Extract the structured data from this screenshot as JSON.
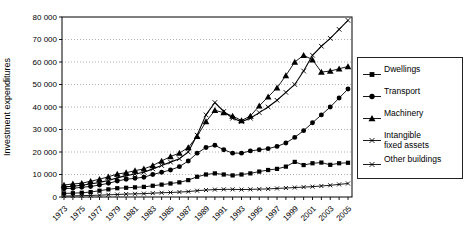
{
  "chart_data": {
    "type": "line",
    "title": "",
    "xlabel": "",
    "ylabel": "Investment expenditures",
    "ylim": [
      0,
      80000
    ],
    "ytick_step": 10000,
    "ytick_labels": [
      "0",
      "10 000",
      "20 000",
      "30 000",
      "40 000",
      "50 000",
      "60 000",
      "70 000",
      "80 000"
    ],
    "xtick_labels": [
      "1973",
      "1975",
      "1977",
      "1979",
      "1981",
      "1983",
      "1985",
      "1987",
      "1989",
      "1991",
      "1993",
      "1995",
      "1997",
      "1999",
      "2001",
      "2003",
      "2005"
    ],
    "x": [
      1973,
      1974,
      1975,
      1976,
      1977,
      1978,
      1979,
      1980,
      1981,
      1982,
      1983,
      1984,
      1985,
      1986,
      1987,
      1988,
      1989,
      1990,
      1991,
      1992,
      1993,
      1994,
      1995,
      1996,
      1997,
      1998,
      1999,
      2000,
      2001,
      2002,
      2003,
      2004,
      2005
    ],
    "grid": "horizontal-dotted",
    "legend_position": "right",
    "series_color": "#000000",
    "series": [
      {
        "name": "Dwellings",
        "marker": "square",
        "values": [
          1600,
          1700,
          1900,
          2200,
          2800,
          3400,
          3900,
          4100,
          4300,
          4500,
          5000,
          5500,
          6000,
          6500,
          7500,
          9000,
          10000,
          10500,
          10000,
          9600,
          10000,
          10500,
          11300,
          12000,
          12500,
          13500,
          15600,
          14200,
          15000,
          15300,
          14300,
          15000,
          15200
        ]
      },
      {
        "name": "Transport",
        "marker": "circle",
        "values": [
          3700,
          3900,
          4300,
          4700,
          5300,
          6100,
          7100,
          7900,
          8300,
          8800,
          10000,
          11000,
          12000,
          13500,
          16000,
          19500,
          22000,
          23000,
          21000,
          19500,
          19500,
          20500,
          21000,
          21500,
          22500,
          24000,
          26500,
          29500,
          33000,
          36500,
          40000,
          44000,
          48000
        ]
      },
      {
        "name": "Machinery",
        "marker": "triangle",
        "values": [
          5300,
          5800,
          6100,
          7000,
          7900,
          9000,
          10200,
          10800,
          11700,
          12500,
          14000,
          16000,
          18000,
          19500,
          22000,
          27000,
          33500,
          38500,
          37500,
          36000,
          34000,
          36000,
          40500,
          44500,
          48500,
          54000,
          60000,
          63000,
          61000,
          55500,
          56000,
          57000,
          58000
        ]
      },
      {
        "name": "Intangible fixed assets",
        "marker": "x",
        "values": [
          400,
          500,
          600,
          700,
          800,
          1000,
          1100,
          1300,
          1400,
          1500,
          1700,
          1900,
          2000,
          2200,
          2400,
          2800,
          3100,
          3300,
          3400,
          3400,
          3300,
          3400,
          3500,
          3600,
          3800,
          4000,
          4200,
          4400,
          4600,
          4900,
          5200,
          5600,
          6000
        ]
      },
      {
        "name": "Other buildings",
        "marker": "x",
        "values": [
          4500,
          4800,
          5200,
          5800,
          6500,
          7300,
          8500,
          9500,
          10200,
          11000,
          12500,
          14000,
          15500,
          17000,
          20000,
          27500,
          36500,
          42000,
          38000,
          35000,
          33500,
          35000,
          37500,
          40000,
          43000,
          46500,
          50000,
          56000,
          63000,
          67000,
          70500,
          74500,
          78500
        ]
      }
    ]
  }
}
